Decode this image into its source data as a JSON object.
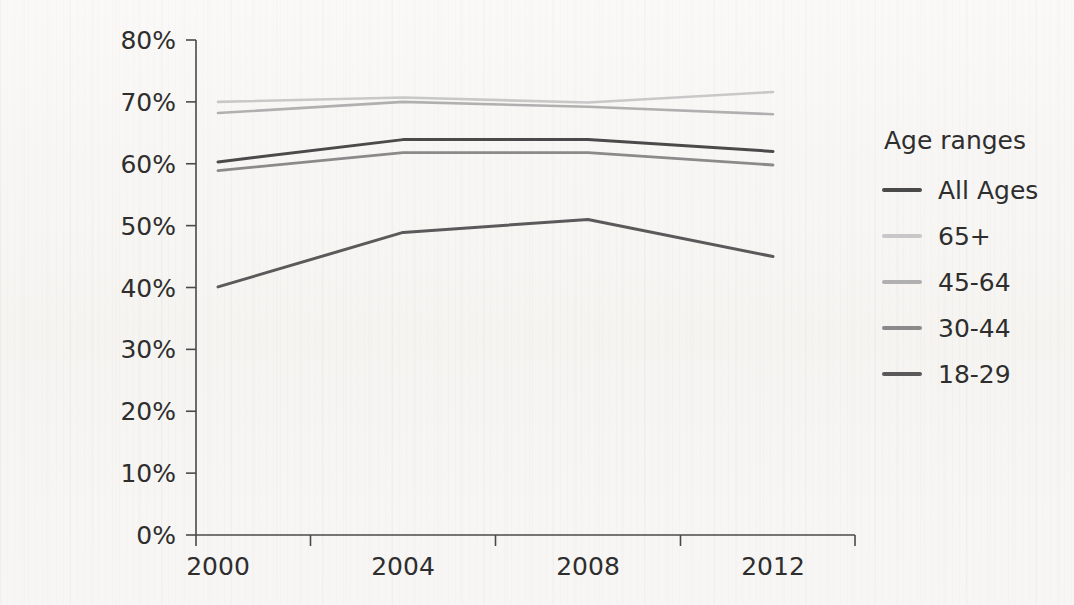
{
  "chart_data": {
    "type": "line",
    "title": "",
    "xlabel": "",
    "ylabel": "",
    "categories": [
      "2000",
      "2004",
      "2008",
      "2012"
    ],
    "x": [
      2000,
      2004,
      2008,
      2012
    ],
    "ylim": [
      0,
      80
    ],
    "y_ticks": [
      0,
      10,
      20,
      30,
      40,
      50,
      60,
      70,
      80
    ],
    "y_tick_labels": [
      "0%",
      "10%",
      "20%",
      "30%",
      "40%",
      "50%",
      "60%",
      "70%",
      "80%"
    ],
    "x_tick_labels": [
      "2000",
      "2004",
      "2008",
      "2012"
    ],
    "grid": false,
    "legend_position": "right",
    "legend_title": "Age ranges",
    "value_suffix": "%",
    "series": [
      {
        "name": "All Ages",
        "color": "#4a4a4a",
        "width": 3.0,
        "values": [
          60.3,
          63.9,
          63.9,
          62.0
        ]
      },
      {
        "name": "65+",
        "color": "#c8c8c8",
        "width": 2.6,
        "values": [
          70.0,
          70.7,
          69.9,
          71.6
        ]
      },
      {
        "name": "45-64",
        "color": "#b0b0b0",
        "width": 2.6,
        "values": [
          68.2,
          70.0,
          69.2,
          68.0
        ]
      },
      {
        "name": "30-44",
        "color": "#8a8a8a",
        "width": 2.8,
        "values": [
          58.9,
          61.8,
          61.8,
          59.8
        ]
      },
      {
        "name": "18-29",
        "color": "#5a5a5a",
        "width": 3.0,
        "values": [
          40.1,
          48.9,
          51.0,
          45.0
        ]
      }
    ]
  },
  "legend": {
    "title": "Age ranges",
    "items": [
      {
        "label": "All Ages",
        "color": "#4a4a4a"
      },
      {
        "label": "65+",
        "color": "#c8c8c8"
      },
      {
        "label": "45-64",
        "color": "#b0b0b0"
      },
      {
        "label": "30-44",
        "color": "#8a8a8a"
      },
      {
        "label": "18-29",
        "color": "#5a5a5a"
      }
    ]
  },
  "axes": {
    "y_labels": [
      "80%",
      "70%",
      "60%",
      "50%",
      "40%",
      "30%",
      "20%",
      "10%",
      "0%"
    ],
    "x_labels": [
      "2000",
      "2004",
      "2008",
      "2012"
    ]
  },
  "colors": {
    "background": "#f7f6f4",
    "axis": "#4a4a4a",
    "text": "#2e2e2e"
  }
}
